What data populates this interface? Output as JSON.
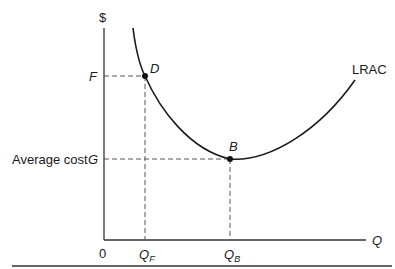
{
  "diagram": {
    "type": "economics-cost-curve",
    "y_axis_label": "$",
    "x_axis_label": "Q",
    "origin_label": "0",
    "curve_label": "LRAC",
    "y_side_label": "Average cost",
    "y_ticks": [
      {
        "label": "F",
        "refers_to": "D"
      },
      {
        "label": "G",
        "refers_to": "B"
      }
    ],
    "x_ticks": [
      {
        "label": "Q",
        "subscript": "F",
        "refers_to": "D"
      },
      {
        "label": "Q",
        "subscript": "B",
        "refers_to": "B"
      }
    ],
    "points": [
      {
        "name": "D",
        "label": "D"
      },
      {
        "name": "B",
        "label": "B"
      }
    ],
    "colors": {
      "line": "#1a1a1a",
      "dashed": "#555555",
      "background": "#ffffff",
      "rule": "#666666"
    }
  }
}
